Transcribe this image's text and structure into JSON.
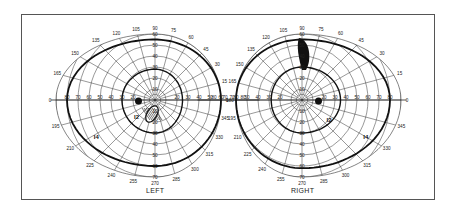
{
  "chart_data": {
    "type": "polar-perimetry",
    "eyes": [
      {
        "name": "LEFT",
        "center": [
          155,
          100
        ],
        "meridian_labels": [
          "90",
          "105",
          "120",
          "135",
          "150",
          "165",
          "180",
          "195",
          "210",
          "225",
          "240",
          "255",
          "270",
          "285",
          "300",
          "75",
          "60"
        ],
        "radial_labels_horizontal": [
          "80",
          "70",
          "60",
          "50",
          "40",
          "30",
          "20",
          "20",
          "30",
          "40",
          "50",
          "60",
          "70",
          "80"
        ],
        "radial_labels_vertical_up": [
          "90",
          "60",
          "50",
          "40",
          "30",
          "20",
          "10"
        ],
        "radial_labels_vertical_down": [
          "10",
          "20",
          "30",
          "40",
          "50",
          "60",
          "70"
        ],
        "isopters": [
          {
            "label": "I4",
            "extent_deg": {
              "temporal": 80,
              "superior": 55,
              "inferior": 60,
              "nasal": 60
            }
          },
          {
            "label": "I2",
            "extent_deg": {
              "temporal": 30,
              "superior": 28,
              "inferior": 30,
              "nasal": 25
            }
          }
        ],
        "scotomas": [
          "blind spot (temporal ~15°)",
          "hatched inferior paracentral scotoma"
        ]
      },
      {
        "name": "RIGHT",
        "center": [
          302,
          100
        ],
        "meridian_labels": [
          "90",
          "105",
          "120",
          "75",
          "60",
          "45",
          "30",
          "15",
          "0",
          "345",
          "330",
          "315",
          "300",
          "285",
          "270",
          "255",
          "240"
        ],
        "radial_labels_horizontal": [
          "80",
          "50",
          "40",
          "30",
          "20",
          "20",
          "30",
          "40",
          "50",
          "60",
          "70",
          "80"
        ],
        "radial_labels_vertical_up": [
          "90",
          "60",
          "50",
          "40",
          "30",
          "20",
          "10"
        ],
        "radial_labels_vertical_down": [
          "10",
          "20",
          "30",
          "40",
          "50",
          "60",
          "70"
        ],
        "isopters": [
          {
            "label": "I4",
            "extent_deg": {
              "temporal": 80,
              "superior": 55,
              "inferior": 62,
              "nasal": 60
            }
          },
          {
            "label": "I2",
            "extent_deg": {
              "temporal": 35,
              "superior": 30,
              "inferior": 30,
              "nasal": 28
            }
          }
        ],
        "scotomas": [
          "blind spot (temporal ~15°)",
          "solid superior scotoma ~15-40°"
        ]
      }
    ],
    "grid": true
  },
  "labels": {
    "left": "LEFT",
    "right": "RIGHT"
  }
}
